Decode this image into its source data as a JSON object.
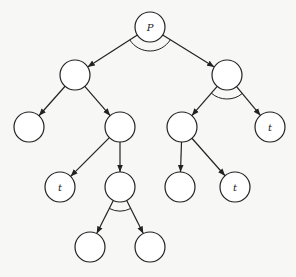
{
  "diagram": {
    "type": "and-or-tree",
    "style": {
      "stroke": "#222222",
      "background": "#f7f7f5",
      "node_fill": "#ffffff",
      "node_radius": 15
    },
    "nodes": [
      {
        "id": "n0",
        "label": "P",
        "x": 150,
        "y": 27
      },
      {
        "id": "n1",
        "label": "",
        "x": 75,
        "y": 75
      },
      {
        "id": "n2",
        "label": "",
        "x": 227,
        "y": 75
      },
      {
        "id": "n3",
        "label": "",
        "x": 29,
        "y": 127
      },
      {
        "id": "n4",
        "label": "",
        "x": 120,
        "y": 127
      },
      {
        "id": "n5",
        "label": "",
        "x": 182,
        "y": 127
      },
      {
        "id": "n6",
        "label": "t",
        "x": 270,
        "y": 127
      },
      {
        "id": "n7",
        "label": "t",
        "x": 60,
        "y": 187
      },
      {
        "id": "n8",
        "label": "",
        "x": 120,
        "y": 187
      },
      {
        "id": "n9",
        "label": "",
        "x": 180,
        "y": 187
      },
      {
        "id": "n10",
        "label": "t",
        "x": 235,
        "y": 187
      },
      {
        "id": "n11",
        "label": "",
        "x": 90,
        "y": 247
      },
      {
        "id": "n12",
        "label": "",
        "x": 150,
        "y": 247
      }
    ],
    "edges": [
      {
        "from": "n0",
        "to": "n1"
      },
      {
        "from": "n0",
        "to": "n2"
      },
      {
        "from": "n1",
        "to": "n3"
      },
      {
        "from": "n1",
        "to": "n4"
      },
      {
        "from": "n2",
        "to": "n5"
      },
      {
        "from": "n2",
        "to": "n6"
      },
      {
        "from": "n4",
        "to": "n7"
      },
      {
        "from": "n4",
        "to": "n8"
      },
      {
        "from": "n5",
        "to": "n9"
      },
      {
        "from": "n5",
        "to": "n10"
      },
      {
        "from": "n8",
        "to": "n11"
      },
      {
        "from": "n8",
        "to": "n12"
      }
    ],
    "and_arcs": [
      {
        "node": "n0",
        "from_child": "n1",
        "to_child": "n2",
        "radius": 24
      },
      {
        "node": "n2",
        "from_child": "n5",
        "to_child": "n6",
        "radius": 24
      },
      {
        "node": "n8",
        "from_child": "n11",
        "to_child": "n12",
        "radius": 24
      }
    ]
  }
}
